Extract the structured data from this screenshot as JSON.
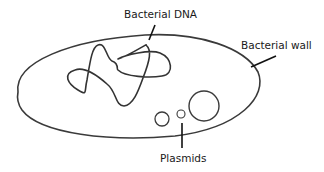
{
  "diagram": {
    "labels": {
      "dna": "Bacterial DNA",
      "wall": "Bacterial wall",
      "plasmids": "Plasmids"
    },
    "colors": {
      "stroke": "#3a3a3a",
      "leader": "#111111",
      "background": "#ffffff"
    }
  }
}
